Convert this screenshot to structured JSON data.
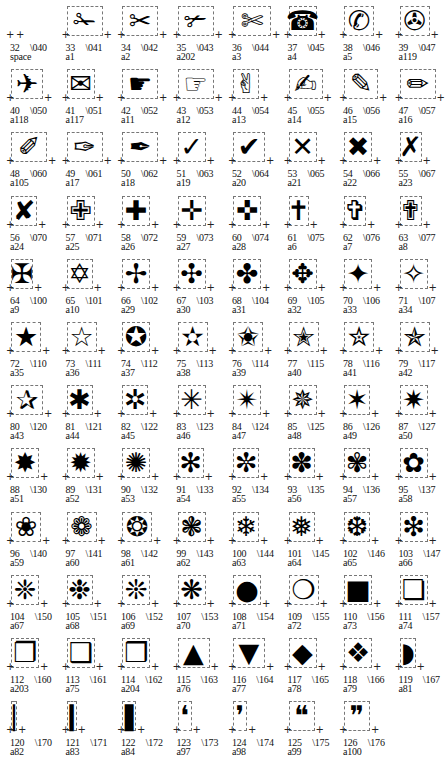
{
  "layout": {
    "columns": 8,
    "col_width": 55.5,
    "row_height": 63.2,
    "row_top": 2
  },
  "cells": [
    {
      "code": "32",
      "octal": "\\040",
      "name": "space",
      "glyph": "",
      "w": 0
    },
    {
      "code": "33",
      "octal": "\\041",
      "name": "a1",
      "glyph": "✁",
      "w": 36
    },
    {
      "code": "34",
      "octal": "\\042",
      "name": "a2",
      "glyph": "✂",
      "w": 36
    },
    {
      "code": "35",
      "octal": "\\043",
      "name": "a202",
      "glyph": "✃",
      "w": 36
    },
    {
      "code": "36",
      "octal": "\\044",
      "name": "a3",
      "glyph": "✄",
      "w": 38
    },
    {
      "code": "37",
      "octal": "\\045",
      "name": "a4",
      "glyph": "☎",
      "w": 28
    },
    {
      "code": "38",
      "octal": "\\046",
      "name": "a5",
      "glyph": "✆",
      "w": 30
    },
    {
      "code": "39",
      "octal": "\\047",
      "name": "a119",
      "glyph": "✇",
      "w": 30
    },
    {
      "code": "40",
      "octal": "\\050",
      "name": "a118",
      "glyph": "✈",
      "w": 32
    },
    {
      "code": "41",
      "octal": "\\051",
      "name": "a117",
      "glyph": "✉",
      "w": 28
    },
    {
      "code": "42",
      "octal": "\\052",
      "name": "a11",
      "glyph": "☛",
      "w": 36
    },
    {
      "code": "43",
      "octal": "\\053",
      "name": "a12",
      "glyph": "☞",
      "w": 36
    },
    {
      "code": "44",
      "octal": "\\054",
      "name": "a13",
      "glyph": "✌",
      "w": 26
    },
    {
      "code": "45",
      "octal": "\\055",
      "name": "a14",
      "glyph": "✍",
      "w": 34
    },
    {
      "code": "46",
      "octal": "\\056",
      "name": "a15",
      "glyph": "✎",
      "w": 34
    },
    {
      "code": "47",
      "octal": "\\057",
      "name": "a16",
      "glyph": "✏",
      "w": 36
    },
    {
      "code": "48",
      "octal": "\\060",
      "name": "a105",
      "glyph": "✐",
      "w": 36
    },
    {
      "code": "49",
      "octal": "\\061",
      "name": "a17",
      "glyph": "✑",
      "w": 36
    },
    {
      "code": "50",
      "octal": "\\062",
      "name": "a18",
      "glyph": "✒",
      "w": 36
    },
    {
      "code": "51",
      "octal": "\\063",
      "name": "a19",
      "glyph": "✓",
      "w": 28
    },
    {
      "code": "52",
      "octal": "\\064",
      "name": "a20",
      "glyph": "✔",
      "w": 32
    },
    {
      "code": "53",
      "octal": "\\065",
      "name": "a21",
      "glyph": "✕",
      "w": 28
    },
    {
      "code": "54",
      "octal": "\\066",
      "name": "a22",
      "glyph": "✖",
      "w": 28
    },
    {
      "code": "55",
      "octal": "\\067",
      "name": "a23",
      "glyph": "✗",
      "w": 22
    },
    {
      "code": "56",
      "octal": "\\070",
      "name": "a24",
      "glyph": "✘",
      "w": 26
    },
    {
      "code": "57",
      "octal": "\\071",
      "name": "a25",
      "glyph": "✙",
      "w": 28
    },
    {
      "code": "58",
      "octal": "\\072",
      "name": "a26",
      "glyph": "✚",
      "w": 28
    },
    {
      "code": "59",
      "octal": "\\073",
      "name": "a27",
      "glyph": "✛",
      "w": 28
    },
    {
      "code": "60",
      "octal": "\\074",
      "name": "a28",
      "glyph": "✜",
      "w": 28
    },
    {
      "code": "61",
      "octal": "\\075",
      "name": "a6",
      "glyph": "✝",
      "w": 20
    },
    {
      "code": "62",
      "octal": "\\076",
      "name": "a7",
      "glyph": "✞",
      "w": 22
    },
    {
      "code": "63",
      "octal": "\\077",
      "name": "a8",
      "glyph": "✟",
      "w": 22
    },
    {
      "code": "64",
      "octal": "\\100",
      "name": "a9",
      "glyph": "✠",
      "w": 22
    },
    {
      "code": "65",
      "octal": "\\101",
      "name": "a10",
      "glyph": "✡",
      "w": 26
    },
    {
      "code": "66",
      "octal": "\\102",
      "name": "a29",
      "glyph": "✢",
      "w": 28
    },
    {
      "code": "67",
      "octal": "\\103",
      "name": "a30",
      "glyph": "✣",
      "w": 28
    },
    {
      "code": "68",
      "octal": "\\104",
      "name": "a31",
      "glyph": "✤",
      "w": 28
    },
    {
      "code": "69",
      "octal": "\\105",
      "name": "a32",
      "glyph": "✥",
      "w": 28
    },
    {
      "code": "70",
      "octal": "\\106",
      "name": "a33",
      "glyph": "✦",
      "w": 28
    },
    {
      "code": "71",
      "octal": "\\107",
      "name": "a34",
      "glyph": "✧",
      "w": 28
    },
    {
      "code": "72",
      "octal": "\\110",
      "name": "a35",
      "glyph": "★",
      "w": 30
    },
    {
      "code": "73",
      "octal": "\\111",
      "name": "a36",
      "glyph": "☆",
      "w": 30
    },
    {
      "code": "74",
      "octal": "\\112",
      "name": "a37",
      "glyph": "✪",
      "w": 28
    },
    {
      "code": "75",
      "octal": "\\113",
      "name": "a38",
      "glyph": "✫",
      "w": 30
    },
    {
      "code": "76",
      "octal": "\\114",
      "name": "a39",
      "glyph": "✬",
      "w": 30
    },
    {
      "code": "77",
      "octal": "\\115",
      "name": "a40",
      "glyph": "✭",
      "w": 30
    },
    {
      "code": "78",
      "octal": "\\116",
      "name": "a41",
      "glyph": "✮",
      "w": 30
    },
    {
      "code": "79",
      "octal": "\\117",
      "name": "a42",
      "glyph": "✯",
      "w": 30
    },
    {
      "code": "80",
      "octal": "\\120",
      "name": "a43",
      "glyph": "✰",
      "w": 32
    },
    {
      "code": "81",
      "octal": "\\121",
      "name": "a44",
      "glyph": "✱",
      "w": 26
    },
    {
      "code": "82",
      "octal": "\\122",
      "name": "a45",
      "glyph": "✲",
      "w": 26
    },
    {
      "code": "83",
      "octal": "\\123",
      "name": "a46",
      "glyph": "✳",
      "w": 28
    },
    {
      "code": "84",
      "octal": "\\124",
      "name": "a47",
      "glyph": "✴",
      "w": 28
    },
    {
      "code": "85",
      "octal": "\\125",
      "name": "a48",
      "glyph": "✵",
      "w": 28
    },
    {
      "code": "86",
      "octal": "\\126",
      "name": "a49",
      "glyph": "✶",
      "w": 26
    },
    {
      "code": "87",
      "octal": "\\127",
      "name": "a50",
      "glyph": "✷",
      "w": 28
    },
    {
      "code": "88",
      "octal": "\\130",
      "name": "a51",
      "glyph": "✸",
      "w": 28
    },
    {
      "code": "89",
      "octal": "\\131",
      "name": "a52",
      "glyph": "✹",
      "w": 28
    },
    {
      "code": "90",
      "octal": "\\132",
      "name": "a53",
      "glyph": "✺",
      "w": 28
    },
    {
      "code": "91",
      "octal": "\\133",
      "name": "a54",
      "glyph": "✻",
      "w": 26
    },
    {
      "code": "92",
      "octal": "\\134",
      "name": "a55",
      "glyph": "✼",
      "w": 26
    },
    {
      "code": "93",
      "octal": "\\135",
      "name": "a56",
      "glyph": "✽",
      "w": 26
    },
    {
      "code": "94",
      "octal": "\\136",
      "name": "a57",
      "glyph": "✾",
      "w": 26
    },
    {
      "code": "95",
      "octal": "\\137",
      "name": "a58",
      "glyph": "✿",
      "w": 28
    },
    {
      "code": "96",
      "octal": "\\140",
      "name": "a59",
      "glyph": "❀",
      "w": 30
    },
    {
      "code": "97",
      "octal": "\\141",
      "name": "a60",
      "glyph": "❁",
      "w": 30
    },
    {
      "code": "98",
      "octal": "\\142",
      "name": "a61",
      "glyph": "❂",
      "w": 30
    },
    {
      "code": "99",
      "octal": "\\143",
      "name": "a62",
      "glyph": "❃",
      "w": 28
    },
    {
      "code": "100",
      "octal": "\\144",
      "name": "a63",
      "glyph": "❄",
      "w": 26
    },
    {
      "code": "101",
      "octal": "\\145",
      "name": "a64",
      "glyph": "❅",
      "w": 26
    },
    {
      "code": "102",
      "octal": "\\146",
      "name": "a65",
      "glyph": "❆",
      "w": 26
    },
    {
      "code": "103",
      "octal": "\\147",
      "name": "a66",
      "glyph": "❇",
      "w": 28
    },
    {
      "code": "104",
      "octal": "\\150",
      "name": "a67",
      "glyph": "❈",
      "w": 28
    },
    {
      "code": "105",
      "octal": "\\151",
      "name": "a68",
      "glyph": "❉",
      "w": 26
    },
    {
      "code": "106",
      "octal": "\\152",
      "name": "a69",
      "glyph": "❊",
      "w": 28
    },
    {
      "code": "107",
      "octal": "\\153",
      "name": "a70",
      "glyph": "❋",
      "w": 28
    },
    {
      "code": "108",
      "octal": "\\154",
      "name": "a71",
      "glyph": "●",
      "w": 28
    },
    {
      "code": "109",
      "octal": "\\155",
      "name": "a72",
      "glyph": "❍",
      "w": 30
    },
    {
      "code": "110",
      "octal": "\\156",
      "name": "a73",
      "glyph": "■",
      "w": 28
    },
    {
      "code": "111",
      "octal": "\\157",
      "name": "a74",
      "glyph": "❏",
      "w": 28
    },
    {
      "code": "112",
      "octal": "\\160",
      "name": "a203",
      "glyph": "❐",
      "w": 28
    },
    {
      "code": "113",
      "octal": "\\161",
      "name": "a75",
      "glyph": "❑",
      "w": 28
    },
    {
      "code": "114",
      "octal": "\\162",
      "name": "a204",
      "glyph": "❒",
      "w": 28
    },
    {
      "code": "115",
      "octal": "\\163",
      "name": "a76",
      "glyph": "▲",
      "w": 32
    },
    {
      "code": "116",
      "octal": "\\164",
      "name": "a77",
      "glyph": "▼",
      "w": 32
    },
    {
      "code": "117",
      "octal": "\\165",
      "name": "a78",
      "glyph": "◆",
      "w": 28
    },
    {
      "code": "118",
      "octal": "\\166",
      "name": "a79",
      "glyph": "❖",
      "w": 28
    },
    {
      "code": "119",
      "octal": "\\167",
      "name": "a81",
      "glyph": "◗",
      "w": 16
    },
    {
      "code": "120",
      "octal": "\\170",
      "name": "a82",
      "glyph": "❘",
      "w": 6
    },
    {
      "code": "121",
      "octal": "\\171",
      "name": "a83",
      "glyph": "❙",
      "w": 10
    },
    {
      "code": "122",
      "octal": "\\172",
      "name": "a84",
      "glyph": "❚",
      "w": 14
    },
    {
      "code": "123",
      "octal": "\\173",
      "name": "a97",
      "glyph": "❛",
      "w": 14
    },
    {
      "code": "124",
      "octal": "\\174",
      "name": "a98",
      "glyph": "❜",
      "w": 14
    },
    {
      "code": "125",
      "octal": "\\175",
      "name": "a99",
      "glyph": "❝",
      "w": 26
    },
    {
      "code": "126",
      "octal": "\\176",
      "name": "a100",
      "glyph": "❞",
      "w": 26
    }
  ]
}
